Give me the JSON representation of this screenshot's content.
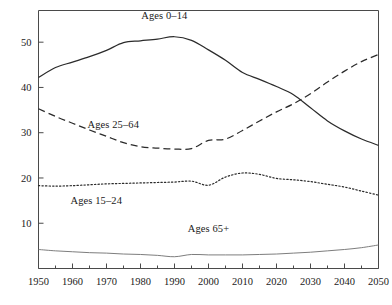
{
  "chart_data": {
    "type": "line",
    "title": "",
    "subtitle": "",
    "xlabel": "",
    "ylabel": "",
    "xlim": [
      1950,
      2050
    ],
    "ylim": [
      0,
      57
    ],
    "grid": false,
    "legend_position": "inline-annotations",
    "x_ticks": [
      1950,
      1960,
      1970,
      1980,
      1990,
      2000,
      2010,
      2020,
      2030,
      2040,
      2050
    ],
    "x_tick_labels": [
      "1950",
      "1960",
      "1970",
      "1980",
      "1990",
      "2000",
      "2010",
      "2020",
      "2030",
      "2040",
      "2050"
    ],
    "x_minor_ticks": [
      1955,
      1965,
      1975,
      1985,
      1995,
      2005,
      2015,
      2025,
      2035,
      2045
    ],
    "y_ticks": [
      10,
      20,
      30,
      40,
      50
    ],
    "y_tick_labels": [
      "10",
      "20",
      "30",
      "40",
      "50"
    ],
    "x": [
      1950,
      1955,
      1960,
      1965,
      1970,
      1975,
      1980,
      1985,
      1990,
      1995,
      2000,
      2005,
      2010,
      2015,
      2020,
      2025,
      2030,
      2035,
      2040,
      2045,
      2050
    ],
    "series": [
      {
        "name": "Ages 0-14",
        "label": "Ages 0–14",
        "style": "solid",
        "color": "#2b2b2b",
        "values": [
          42.2,
          44.4,
          45.6,
          46.8,
          48.2,
          49.9,
          50.3,
          50.7,
          51.2,
          50.4,
          48.3,
          46.0,
          43.3,
          41.8,
          40.2,
          38.4,
          35.5,
          32.6,
          30.4,
          28.6,
          27.2
        ]
      },
      {
        "name": "Ages 25-64",
        "label": "Ages 25–64",
        "style": "dashed",
        "color": "#2b2b2b",
        "values": [
          35.3,
          33.6,
          32.1,
          30.6,
          29.2,
          27.8,
          26.9,
          26.6,
          26.4,
          26.5,
          28.3,
          28.6,
          30.5,
          32.6,
          34.6,
          36.4,
          38.6,
          41.2,
          43.6,
          45.7,
          47.3
        ]
      },
      {
        "name": "Ages 15-24",
        "label": "Ages 15–24",
        "style": "dotted",
        "color": "#2b2b2b",
        "values": [
          18.3,
          18.2,
          18.3,
          18.5,
          18.7,
          18.8,
          18.9,
          19.0,
          19.1,
          19.3,
          18.4,
          20.2,
          21.1,
          20.8,
          19.9,
          19.6,
          19.2,
          18.6,
          18.0,
          17.1,
          16.2
        ]
      },
      {
        "name": "Ages 65+",
        "label": "Ages 65+",
        "style": "solid-thin",
        "color": "#6e6e6e",
        "values": [
          4.2,
          3.9,
          3.7,
          3.5,
          3.4,
          3.2,
          3.1,
          2.9,
          2.6,
          3.1,
          3.0,
          3.0,
          3.0,
          3.1,
          3.2,
          3.4,
          3.6,
          3.9,
          4.2,
          4.6,
          5.2
        ]
      }
    ],
    "annotations": [
      {
        "text": "Ages 0–14",
        "x": 1987,
        "y": 55.5
      },
      {
        "text": "Ages 25–64",
        "x": 1972,
        "y": 31.5
      },
      {
        "text": "Ages 15–24",
        "x": 1967,
        "y": 14.7
      },
      {
        "text": "Ages 65+",
        "x": 2000,
        "y": 8.5
      }
    ]
  }
}
